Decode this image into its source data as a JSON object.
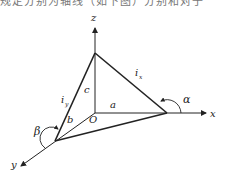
{
  "header": {
    "cropped_text": "规定分别为轴线（如下图）分别和对于"
  },
  "diagram": {
    "axes": {
      "x": "x",
      "y": "y",
      "z": "z",
      "origin": "O"
    },
    "segments": {
      "a": "a",
      "b": "b",
      "c": "c"
    },
    "edges": {
      "ix_main": "i",
      "ix_sub": "x",
      "iy_main": "i",
      "iy_sub": "y"
    },
    "angles": {
      "alpha": "α",
      "beta": "β"
    },
    "colors": {
      "line": "#222222",
      "background": "#ffffff"
    }
  }
}
